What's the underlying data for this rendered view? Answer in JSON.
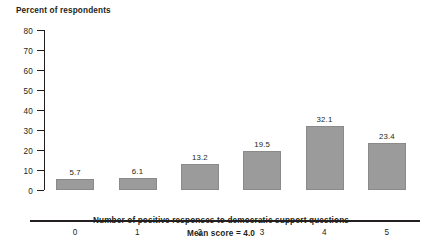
{
  "chart_data": {
    "type": "bar",
    "title": "",
    "categories": [
      "0",
      "1",
      "2",
      "3",
      "4",
      "5"
    ],
    "values": [
      5.7,
      6.1,
      13.2,
      19.5,
      32.1,
      23.4
    ],
    "value_labels": [
      "5.7",
      "6.1",
      "13.2",
      "19.5",
      "32.1",
      "23.4"
    ],
    "xlabel": "Number of positive responses to democratic support questions",
    "ylabel": "Percent of respondents",
    "ylim": [
      0,
      80
    ],
    "yticks": [
      0,
      10,
      20,
      30,
      40,
      50,
      60,
      70,
      80
    ],
    "ytick_labels": [
      "0",
      "10",
      "20",
      "30",
      "40",
      "50",
      "60",
      "70",
      "80"
    ],
    "grid": false,
    "legend": false,
    "annotations": [
      "Mean score = 4.0"
    ],
    "bar_color": "#9b9b9b",
    "axis_color": "#231f20",
    "text_color": "#231f20",
    "background_color": "#ffffff"
  },
  "notes": {
    "mean_score": "Mean score = 4.0"
  }
}
